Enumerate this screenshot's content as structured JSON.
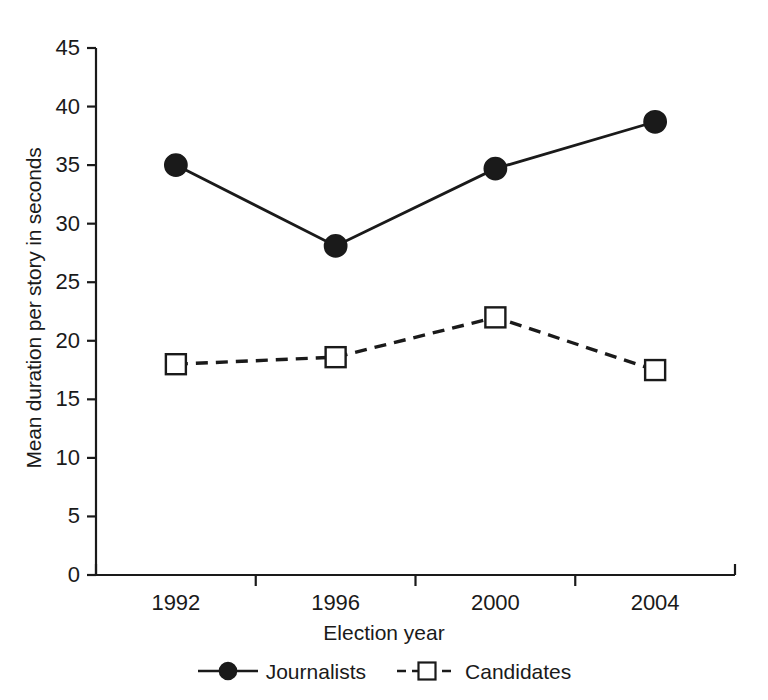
{
  "chart_data": {
    "type": "line",
    "title": "",
    "xlabel": "Election year",
    "ylabel": "Mean duration per story in seconds",
    "categories": [
      "1992",
      "1996",
      "2000",
      "2004"
    ],
    "x": [
      1992,
      1996,
      2000,
      2004
    ],
    "ylim": [
      0,
      45
    ],
    "xlim_categories": 4,
    "y_ticks": [
      0,
      5,
      10,
      15,
      20,
      25,
      30,
      35,
      40,
      45
    ],
    "y_tick_labels": [
      "0",
      "5",
      "10",
      "15",
      "20",
      "25",
      "30",
      "35",
      "40",
      "45"
    ],
    "x_tick_labels": [
      "1992",
      "1996",
      "2000",
      "2004"
    ],
    "grid": false,
    "legend_position": "bottom-center",
    "series": [
      {
        "name": "Journalists",
        "values": [
          35.0,
          28.1,
          34.7,
          38.7
        ],
        "marker": "filled-circle",
        "line_style": "solid",
        "color": "#1a1a1a"
      },
      {
        "name": "Candidates",
        "values": [
          18.0,
          18.6,
          22.0,
          17.5
        ],
        "marker": "open-square",
        "line_style": "dashed",
        "color": "#1a1a1a"
      }
    ]
  },
  "axes": {
    "y_title": "Mean duration per story in seconds",
    "x_title": "Election year"
  },
  "legend": {
    "entries": [
      {
        "label": "Journalists"
      },
      {
        "label": "Candidates"
      }
    ]
  },
  "colors": {
    "ink": "#1a1a1a",
    "background": "#ffffff",
    "marker_fill_journalists": "#1a1a1a",
    "marker_fill_candidates": "#ffffff"
  }
}
